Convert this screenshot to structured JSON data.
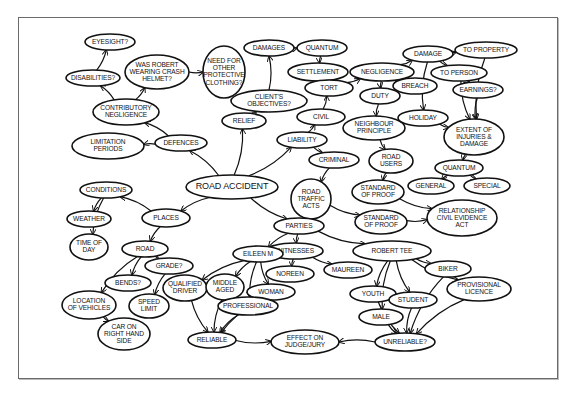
{
  "diagram": {
    "title": "ROAD ACCIDENT",
    "nodes": [
      {
        "id": "road_accident",
        "label": "ROAD ACCIDENT",
        "x": 232,
        "y": 187,
        "rx": 46,
        "ry": 12,
        "big": true
      },
      {
        "id": "eyesight",
        "label": "EYESIGHT?",
        "x": 110,
        "y": 42,
        "rx": 25,
        "ry": 8
      },
      {
        "id": "was_robert",
        "label": "WAS ROBERT|WEARING CRASH|HELMET?",
        "x": 157,
        "y": 72,
        "rx": 32,
        "ry": 17
      },
      {
        "id": "need_for",
        "label": "NEED FOR|OTHER|PROTECTIVE|CLOTHING?",
        "x": 224,
        "y": 72,
        "rx": 21,
        "ry": 26
      },
      {
        "id": "disabilities",
        "label": "DISABILITIES?",
        "x": 93,
        "y": 78,
        "rx": 27,
        "ry": 8
      },
      {
        "id": "contributory",
        "label": "CONTRIBUTORY|NEGLIGENCE",
        "x": 126,
        "y": 112,
        "rx": 33,
        "ry": 13
      },
      {
        "id": "relief",
        "label": "RELIEF",
        "x": 244,
        "y": 121,
        "rx": 22,
        "ry": 8
      },
      {
        "id": "clients_objectives",
        "label": "CLIENT'S|OBJECTIVES?",
        "x": 269,
        "y": 101,
        "rx": 38,
        "ry": 11
      },
      {
        "id": "damages",
        "label": "DAMAGES",
        "x": 269,
        "y": 48,
        "rx": 25,
        "ry": 8
      },
      {
        "id": "quantum_top",
        "label": "QUANTUM",
        "x": 322,
        "y": 48,
        "rx": 25,
        "ry": 8
      },
      {
        "id": "settlement",
        "label": "SETTLEMENT",
        "x": 318,
        "y": 72,
        "rx": 30,
        "ry": 9
      },
      {
        "id": "limitation",
        "label": "LIMITATION|PERIODS",
        "x": 108,
        "y": 146,
        "rx": 36,
        "ry": 13
      },
      {
        "id": "defences",
        "label": "DEFENCES",
        "x": 181,
        "y": 143,
        "rx": 26,
        "ry": 8
      },
      {
        "id": "negligence",
        "label": "NEGLIGENCE",
        "x": 382,
        "y": 72,
        "rx": 32,
        "ry": 9
      },
      {
        "id": "tort",
        "label": "TORT",
        "x": 329,
        "y": 88,
        "rx": 24,
        "ry": 8
      },
      {
        "id": "breach",
        "label": "BREACH",
        "x": 415,
        "y": 86,
        "rx": 22,
        "ry": 8
      },
      {
        "id": "duty",
        "label": "DUTY",
        "x": 380,
        "y": 96,
        "rx": 20,
        "ry": 8
      },
      {
        "id": "civil",
        "label": "CIVIL",
        "x": 321,
        "y": 117,
        "rx": 24,
        "ry": 8
      },
      {
        "id": "neighbour",
        "label": "NEIGHBOUR|PRINCIPLE",
        "x": 374,
        "y": 128,
        "rx": 31,
        "ry": 12
      },
      {
        "id": "liability",
        "label": "LIABILITY",
        "x": 302,
        "y": 140,
        "rx": 25,
        "ry": 8
      },
      {
        "id": "criminal",
        "label": "CRIMINAL",
        "x": 334,
        "y": 160,
        "rx": 25,
        "ry": 8
      },
      {
        "id": "road_users",
        "label": "ROAD|USERS",
        "x": 391,
        "y": 161,
        "rx": 22,
        "ry": 12
      },
      {
        "id": "damage",
        "label": "DAMAGE",
        "x": 428,
        "y": 54,
        "rx": 25,
        "ry": 8
      },
      {
        "id": "to_property",
        "label": "TO PROPERTY",
        "x": 486,
        "y": 50,
        "rx": 31,
        "ry": 8
      },
      {
        "id": "to_person",
        "label": "TO PERSON",
        "x": 459,
        "y": 73,
        "rx": 28,
        "ry": 8
      },
      {
        "id": "earnings",
        "label": "EARNINGS?",
        "x": 478,
        "y": 90,
        "rx": 25,
        "ry": 8
      },
      {
        "id": "holiday",
        "label": "HOLIDAY",
        "x": 423,
        "y": 118,
        "rx": 25,
        "ry": 8
      },
      {
        "id": "extent",
        "label": "EXTENT OF|INJURIES &|DAMAGE",
        "x": 474,
        "y": 137,
        "rx": 30,
        "ry": 18
      },
      {
        "id": "quantum",
        "label": "QUANTUM",
        "x": 459,
        "y": 168,
        "rx": 24,
        "ry": 8
      },
      {
        "id": "general",
        "label": "GENERAL",
        "x": 431,
        "y": 186,
        "rx": 23,
        "ry": 8
      },
      {
        "id": "special",
        "label": "SPECIAL",
        "x": 487,
        "y": 186,
        "rx": 23,
        "ry": 8
      },
      {
        "id": "road_traffic_acts",
        "label": "ROAD|TRAFFIC|ACTS",
        "x": 311,
        "y": 199,
        "rx": 20,
        "ry": 20
      },
      {
        "id": "sop_upper",
        "label": "STANDARD|OF PROOF",
        "x": 378,
        "y": 192,
        "rx": 26,
        "ry": 12
      },
      {
        "id": "sop_lower",
        "label": "STANDARD|OF PROOF",
        "x": 381,
        "y": 222,
        "rx": 26,
        "ry": 12
      },
      {
        "id": "relationship",
        "label": "RELATIONSHIP|CIVIL EVIDENCE|ACT",
        "x": 462,
        "y": 218,
        "rx": 35,
        "ry": 18
      },
      {
        "id": "conditions",
        "label": "CONDITIONS",
        "x": 106,
        "y": 190,
        "rx": 26,
        "ry": 8
      },
      {
        "id": "weather",
        "label": "WEATHER",
        "x": 89,
        "y": 219,
        "rx": 22,
        "ry": 8
      },
      {
        "id": "places",
        "label": "PLACES",
        "x": 166,
        "y": 218,
        "rx": 24,
        "ry": 9
      },
      {
        "id": "time_of_day",
        "label": "TIME OF|DAY",
        "x": 89,
        "y": 247,
        "rx": 19,
        "ry": 13
      },
      {
        "id": "road",
        "label": "ROAD",
        "x": 145,
        "y": 249,
        "rx": 23,
        "ry": 8
      },
      {
        "id": "parties",
        "label": "PARTIES",
        "x": 299,
        "y": 226,
        "rx": 25,
        "ry": 8
      },
      {
        "id": "witnesses",
        "label": "WITNESSES",
        "x": 295,
        "y": 251,
        "rx": 28,
        "ry": 8
      },
      {
        "id": "robert_tee",
        "label": "ROBERT TEE",
        "x": 392,
        "y": 251,
        "rx": 39,
        "ry": 10
      },
      {
        "id": "eileen",
        "label": "EILEEN M",
        "x": 258,
        "y": 254,
        "rx": 25,
        "ry": 8
      },
      {
        "id": "grade",
        "label": "GRADE?",
        "x": 169,
        "y": 266,
        "rx": 24,
        "ry": 8
      },
      {
        "id": "noreen",
        "label": "NOREEN",
        "x": 290,
        "y": 274,
        "rx": 24,
        "ry": 8
      },
      {
        "id": "maureen",
        "label": "MAUREEN",
        "x": 348,
        "y": 270,
        "rx": 24,
        "ry": 8
      },
      {
        "id": "biker",
        "label": "BIKER",
        "x": 448,
        "y": 269,
        "rx": 23,
        "ry": 8
      },
      {
        "id": "bends",
        "label": "BENDS?",
        "x": 128,
        "y": 283,
        "rx": 23,
        "ry": 8
      },
      {
        "id": "qualified_driver",
        "label": "QUALIFIED|DRIVER",
        "x": 185,
        "y": 288,
        "rx": 22,
        "ry": 13
      },
      {
        "id": "middle_aged",
        "label": "MIDDLE|AGED",
        "x": 225,
        "y": 287,
        "rx": 19,
        "ry": 13
      },
      {
        "id": "woman",
        "label": "WOMAN",
        "x": 271,
        "y": 292,
        "rx": 24,
        "ry": 8
      },
      {
        "id": "youth",
        "label": "YOUTH",
        "x": 373,
        "y": 294,
        "rx": 23,
        "ry": 8
      },
      {
        "id": "provisional",
        "label": "PROVISIONAL|LICENCE",
        "x": 479,
        "y": 289,
        "rx": 32,
        "ry": 12
      },
      {
        "id": "student",
        "label": "STUDENT",
        "x": 413,
        "y": 300,
        "rx": 24,
        "ry": 8
      },
      {
        "id": "location",
        "label": "LOCATION|OF VEHICLES",
        "x": 89,
        "y": 305,
        "rx": 27,
        "ry": 14
      },
      {
        "id": "speed_limit",
        "label": "SPEED|LIMIT",
        "x": 149,
        "y": 306,
        "rx": 20,
        "ry": 12
      },
      {
        "id": "professional",
        "label": "PROFESSIONAL",
        "x": 248,
        "y": 306,
        "rx": 30,
        "ry": 9
      },
      {
        "id": "male",
        "label": "MALE",
        "x": 381,
        "y": 317,
        "rx": 22,
        "ry": 8
      },
      {
        "id": "car_on",
        "label": "CAR ON|RIGHT HAND|SIDE",
        "x": 124,
        "y": 334,
        "rx": 26,
        "ry": 16
      },
      {
        "id": "reliable",
        "label": "RELIABLE",
        "x": 212,
        "y": 340,
        "rx": 24,
        "ry": 8
      },
      {
        "id": "effect",
        "label": "EFFECT ON|JUDGE/JURY",
        "x": 305,
        "y": 342,
        "rx": 34,
        "ry": 12
      },
      {
        "id": "unreliable",
        "label": "UNRELIABLE?",
        "x": 405,
        "y": 342,
        "rx": 30,
        "ry": 9
      }
    ],
    "edges": [
      [
        "road_accident",
        "defences"
      ],
      [
        "road_accident",
        "relief"
      ],
      [
        "road_accident",
        "liability"
      ],
      [
        "road_accident",
        "places"
      ],
      [
        "road_accident",
        "parties"
      ],
      [
        "defences",
        "contributory"
      ],
      [
        "defences",
        "limitation"
      ],
      [
        "contributory",
        "disabilities"
      ],
      [
        "contributory",
        "was_robert"
      ],
      [
        "disabilities",
        "eyesight"
      ],
      [
        "was_robert",
        "need_for"
      ],
      [
        "relief",
        "clients_objectives"
      ],
      [
        "clients_objectives",
        "damages"
      ],
      [
        "damages",
        "quantum_top"
      ],
      [
        "quantum_top",
        "settlement"
      ],
      [
        "liability",
        "civil"
      ],
      [
        "liability",
        "criminal"
      ],
      [
        "civil",
        "tort"
      ],
      [
        "tort",
        "negligence"
      ],
      [
        "negligence",
        "breach"
      ],
      [
        "negligence",
        "duty"
      ],
      [
        "negligence",
        "damage"
      ],
      [
        "duty",
        "neighbour"
      ],
      [
        "neighbour",
        "road_users"
      ],
      [
        "road_users",
        "sop_upper"
      ],
      [
        "criminal",
        "road_traffic_acts"
      ],
      [
        "road_traffic_acts",
        "sop_lower"
      ],
      [
        "sop_upper",
        "relationship"
      ],
      [
        "sop_lower",
        "relationship"
      ],
      [
        "damage",
        "to_property"
      ],
      [
        "damage",
        "to_person"
      ],
      [
        "damage",
        "holiday"
      ],
      [
        "to_person",
        "earnings"
      ],
      [
        "to_person",
        "extent"
      ],
      [
        "to_property",
        "extent"
      ],
      [
        "earnings",
        "extent"
      ],
      [
        "holiday",
        "extent"
      ],
      [
        "extent",
        "quantum"
      ],
      [
        "quantum",
        "general"
      ],
      [
        "quantum",
        "special"
      ],
      [
        "places",
        "conditions"
      ],
      [
        "places",
        "road"
      ],
      [
        "conditions",
        "weather"
      ],
      [
        "conditions",
        "time_of_day"
      ],
      [
        "road",
        "bends"
      ],
      [
        "road",
        "grade"
      ],
      [
        "road",
        "location"
      ],
      [
        "grade",
        "speed_limit"
      ],
      [
        "location",
        "car_on"
      ],
      [
        "parties",
        "witnesses"
      ],
      [
        "parties",
        "robert_tee"
      ],
      [
        "parties",
        "eileen"
      ],
      [
        "witnesses",
        "noreen"
      ],
      [
        "witnesses",
        "maureen"
      ],
      [
        "eileen",
        "qualified_driver"
      ],
      [
        "eileen",
        "middle_aged"
      ],
      [
        "eileen",
        "professional"
      ],
      [
        "eileen",
        "woman"
      ],
      [
        "qualified_driver",
        "reliable"
      ],
      [
        "middle_aged",
        "reliable"
      ],
      [
        "professional",
        "reliable"
      ],
      [
        "woman",
        "reliable"
      ],
      [
        "robert_tee",
        "biker"
      ],
      [
        "robert_tee",
        "youth"
      ],
      [
        "robert_tee",
        "student"
      ],
      [
        "robert_tee",
        "male"
      ],
      [
        "robert_tee",
        "provisional"
      ],
      [
        "youth",
        "unreliable"
      ],
      [
        "male",
        "unreliable"
      ],
      [
        "student",
        "unreliable"
      ],
      [
        "biker",
        "unreliable"
      ],
      [
        "provisional",
        "unreliable"
      ],
      [
        "reliable",
        "effect"
      ],
      [
        "unreliable",
        "effect"
      ]
    ]
  }
}
